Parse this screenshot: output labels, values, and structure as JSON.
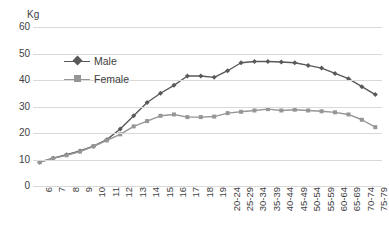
{
  "chart_data": {
    "type": "line",
    "title": "",
    "xlabel": "",
    "ylabel": "Kg",
    "yunit_label": "Kg",
    "ylim": [
      0,
      60
    ],
    "ytick_values": [
      0,
      10,
      20,
      30,
      40,
      50,
      60
    ],
    "ytick_labels": [
      "0",
      "10",
      "20",
      "30",
      "40",
      "50",
      "60"
    ],
    "grid": true,
    "grid_axis": "y",
    "legend_position": "inside-top-left",
    "categories": [
      "6",
      "7",
      "8",
      "9",
      "10",
      "11",
      "12",
      "13",
      "14",
      "15",
      "16",
      "17",
      "18",
      "19",
      "20-24",
      "25-29",
      "30-34",
      "35-39",
      "40-44",
      "45-49",
      "50-54",
      "55-59",
      "60-64",
      "65-69",
      "70-74",
      "75-79"
    ],
    "series": [
      {
        "name": "Male",
        "color": "#595959",
        "marker": "diamond",
        "values": [
          9.0,
          10.5,
          11.8,
          13.2,
          15.0,
          17.5,
          21.5,
          26.5,
          31.5,
          35.0,
          38.0,
          41.5,
          41.5,
          41.0,
          43.5,
          46.5,
          47.0,
          47.0,
          46.8,
          46.5,
          45.5,
          44.5,
          42.5,
          40.5,
          37.5,
          34.5
        ]
      },
      {
        "name": "Female",
        "color": "#969696",
        "marker": "square",
        "values": [
          9.0,
          10.4,
          11.6,
          13.0,
          15.0,
          17.2,
          19.5,
          22.5,
          24.5,
          26.5,
          27.0,
          26.0,
          26.0,
          26.2,
          27.5,
          28.0,
          28.5,
          29.0,
          28.5,
          28.8,
          28.5,
          28.2,
          27.8,
          27.0,
          25.0,
          22.2
        ]
      }
    ]
  },
  "legend": {
    "entries": [
      {
        "label": "Male",
        "color": "#595959"
      },
      {
        "label": "Female",
        "color": "#969696"
      }
    ]
  }
}
